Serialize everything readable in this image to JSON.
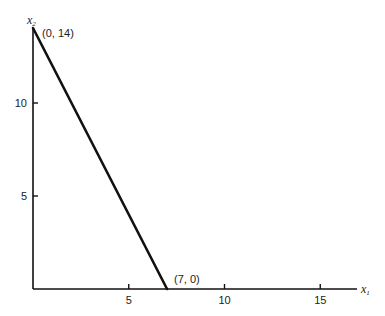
{
  "chart_data": {
    "type": "line",
    "title": "",
    "xlabel": "x1",
    "ylabel": "x2",
    "x_axis": {
      "label_main": "x",
      "label_sub": "1",
      "ticks": [
        5,
        10,
        15
      ],
      "tick_labels": [
        "5",
        "10",
        "15"
      ],
      "range": [
        0,
        17
      ]
    },
    "y_axis": {
      "label_main": "x",
      "label_sub": "2",
      "ticks": [
        5,
        10
      ],
      "tick_labels": [
        "5",
        "10"
      ],
      "range": [
        0,
        14
      ]
    },
    "grid": false,
    "legend": null,
    "series": [
      {
        "name": "constraint line",
        "x": [
          0,
          7
        ],
        "y": [
          14,
          0
        ]
      }
    ],
    "annotations": [
      {
        "text": "(0, 14)",
        "x": 0,
        "y": 14
      },
      {
        "text": "(7, 0)",
        "x": 7,
        "y": 0
      }
    ]
  }
}
